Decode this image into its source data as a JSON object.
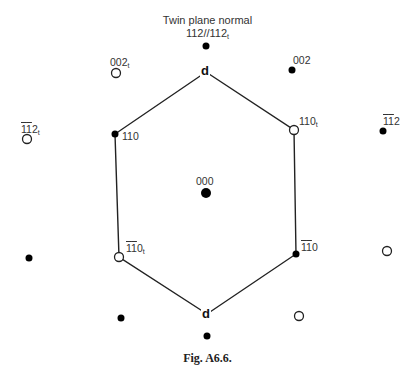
{
  "figure": {
    "title_line1": "Twin plane normal",
    "title_line2": "112//112",
    "title_line2_sub": "t",
    "caption": "Fig. A6.6.",
    "colors": {
      "line": "#222222",
      "filled_spot": "#000000",
      "open_spot": "#222222",
      "text": "#333333"
    }
  },
  "hexagon": {
    "vertices": [
      {
        "x": 206,
        "y": 72,
        "kind": "d"
      },
      {
        "x": 294,
        "y": 130,
        "kind": "open"
      },
      {
        "x": 296,
        "y": 254,
        "kind": "filled"
      },
      {
        "x": 207,
        "y": 314,
        "kind": "d"
      },
      {
        "x": 119,
        "y": 257,
        "kind": "open"
      },
      {
        "x": 115,
        "y": 134,
        "kind": "filled"
      }
    ],
    "d_label_top": "d",
    "d_label_bottom": "d"
  },
  "spots": [
    {
      "id": "twin-normal",
      "x": 206,
      "y": 46,
      "r": 3.5,
      "type": "filled",
      "label": ""
    },
    {
      "id": "002t",
      "x": 116,
      "y": 73,
      "r": 4.5,
      "type": "open",
      "label": "002",
      "sub": "t"
    },
    {
      "id": "002",
      "x": 292,
      "y": 70,
      "r": 3.5,
      "type": "filled",
      "label": "002"
    },
    {
      "id": "-1-12t",
      "x": 27,
      "y": 139,
      "r": 4.5,
      "type": "open",
      "label": "112",
      "sub": "t",
      "bars": 2
    },
    {
      "id": "110",
      "x": 115,
      "y": 134,
      "r": 3.5,
      "type": "filled",
      "label": "110"
    },
    {
      "id": "110t",
      "x": 294,
      "y": 130,
      "r": 4.5,
      "type": "open",
      "label": "110",
      "sub": "t"
    },
    {
      "id": "-1-12",
      "x": 383,
      "y": 131,
      "r": 3.5,
      "type": "filled",
      "label": "112",
      "bars": 2
    },
    {
      "id": "000",
      "x": 206,
      "y": 193,
      "r": 5,
      "type": "filled",
      "label": "000"
    },
    {
      "id": "left-far",
      "x": 29,
      "y": 258,
      "r": 3.5,
      "type": "filled",
      "label": ""
    },
    {
      "id": "-1-10t",
      "x": 119,
      "y": 257,
      "r": 4.5,
      "type": "open",
      "label": "110",
      "sub": "t",
      "bars": 2
    },
    {
      "id": "-1-10",
      "x": 296,
      "y": 254,
      "r": 3.5,
      "type": "filled",
      "label": "110",
      "bars": 2
    },
    {
      "id": "right-far",
      "x": 387,
      "y": 251,
      "r": 4.5,
      "type": "open",
      "label": ""
    },
    {
      "id": "lower-left",
      "x": 121,
      "y": 318,
      "r": 3.5,
      "type": "filled",
      "label": ""
    },
    {
      "id": "lower-right",
      "x": 299,
      "y": 316,
      "r": 4.5,
      "type": "open",
      "label": ""
    },
    {
      "id": "bottom",
      "x": 207,
      "y": 336,
      "r": 3.5,
      "type": "filled",
      "label": ""
    }
  ],
  "labels": {
    "l_002t": "002",
    "l_002t_sub": "t",
    "l_002": "002",
    "l_112t_bar1": "1",
    "l_112t_bar2": "1",
    "l_112t_rest": "2",
    "l_112t_sub": "t",
    "l_110": "110",
    "l_110t": "110",
    "l_110t_sub": "t",
    "l_112_bar1": "1",
    "l_112_bar2": "1",
    "l_112_rest": "2",
    "l_000": "000",
    "l_110bt_bar1": "1",
    "l_110bt_bar2": "1",
    "l_110bt_rest": "0",
    "l_110bt_sub": "t",
    "l_110b_bar1": "1",
    "l_110b_bar2": "1",
    "l_110b_rest": "0"
  }
}
